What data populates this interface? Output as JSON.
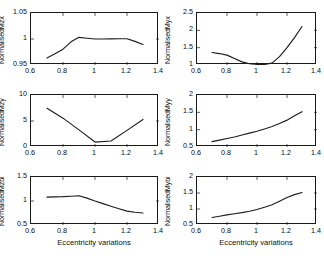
{
  "figure": {
    "type": "multi-panel-line-chart",
    "panels": 6,
    "rows": 3,
    "cols": 2,
    "shared_xlabel": "Eccentricity variations"
  },
  "chart_data": [
    {
      "id": "mzx",
      "type": "line",
      "title": "",
      "ylabel": "NormalisedMzx",
      "xlabel": "",
      "xlim": [
        0.6,
        1.4
      ],
      "ylim": [
        0.95,
        1.05
      ],
      "xticks": [
        0.6,
        0.8,
        1,
        1.2,
        1.4
      ],
      "xticklabels": [
        "0.6",
        "0.8",
        "1",
        "1.2",
        "1.4"
      ],
      "yticks": [
        0.95,
        1,
        1.05
      ],
      "yticklabels": [
        "0.95",
        "1",
        "1.05"
      ],
      "grid": false,
      "legend": null,
      "x": [
        0.7,
        0.75,
        0.8,
        0.85,
        0.9,
        0.95,
        1.0,
        1.05,
        1.1,
        1.15,
        1.2,
        1.25,
        1.3
      ],
      "values": [
        0.9635,
        0.9715,
        0.9805,
        0.9945,
        1.0032,
        1.0015,
        1.0,
        1.0,
        1.0003,
        1.0005,
        1.0005,
        0.9955,
        0.9895
      ]
    },
    {
      "id": "myx",
      "type": "line",
      "title": "",
      "ylabel": "NormalisedMyx",
      "xlabel": "",
      "xlim": [
        0.6,
        1.4
      ],
      "ylim": [
        1,
        2.5
      ],
      "xticks": [
        0.6,
        0.8,
        1,
        1.2,
        1.4
      ],
      "xticklabels": [
        "0.6",
        "0.8",
        "1",
        "1.2",
        "1.4"
      ],
      "yticks": [
        1,
        1.5,
        2,
        2.5
      ],
      "yticklabels": [
        "1",
        "1.5",
        "2",
        "2.5"
      ],
      "grid": false,
      "legend": null,
      "x": [
        0.7,
        0.75,
        0.8,
        0.85,
        0.9,
        0.95,
        1.0,
        1.05,
        1.1,
        1.15,
        1.2,
        1.25,
        1.3
      ],
      "values": [
        1.36,
        1.33,
        1.285,
        1.19,
        1.09,
        1.035,
        1.015,
        1.02,
        1.055,
        1.24,
        1.5,
        1.79,
        2.11
      ]
    },
    {
      "id": "mzy",
      "type": "line",
      "title": "",
      "ylabel": "NormalisedMzy",
      "xlabel": "",
      "xlim": [
        0.6,
        1.4
      ],
      "ylim": [
        0,
        10
      ],
      "xticks": [
        0.6,
        0.8,
        1,
        1.2,
        1.4
      ],
      "xticklabels": [
        "0.6",
        "0.8",
        "1",
        "1.2",
        "1.4"
      ],
      "yticks": [
        0,
        5,
        10
      ],
      "yticklabels": [
        "0",
        "5",
        "10"
      ],
      "grid": false,
      "legend": null,
      "x": [
        0.7,
        0.8,
        0.9,
        1.0,
        1.1,
        1.2,
        1.3
      ],
      "values": [
        7.45,
        5.55,
        3.3,
        0.95,
        1.15,
        3.2,
        5.3
      ]
    },
    {
      "id": "myy",
      "type": "line",
      "title": "",
      "ylabel": "NormalisedMyy",
      "xlabel": "",
      "xlim": [
        0.6,
        1.4
      ],
      "ylim": [
        0.5,
        2
      ],
      "xticks": [
        0.6,
        0.8,
        1,
        1.2,
        1.4
      ],
      "xticklabels": [
        "0.6",
        "0.8",
        "1",
        "1.2",
        "1.4"
      ],
      "yticks": [
        0.5,
        1,
        1.5,
        2
      ],
      "yticklabels": [
        "0.5",
        "1",
        "1.5",
        "2"
      ],
      "grid": false,
      "legend": null,
      "x": [
        0.7,
        0.75,
        0.8,
        0.85,
        0.9,
        0.95,
        1.0,
        1.05,
        1.1,
        1.15,
        1.2,
        1.25,
        1.3
      ],
      "values": [
        0.655,
        0.7,
        0.745,
        0.79,
        0.845,
        0.9,
        0.955,
        1.02,
        1.09,
        1.18,
        1.275,
        1.4,
        1.52
      ]
    },
    {
      "id": "mzbi",
      "type": "line",
      "title": "",
      "ylabel": "NormalisedMzbi",
      "xlabel": "Eccentricity variations",
      "xlim": [
        0.6,
        1.4
      ],
      "ylim": [
        0.5,
        1.5
      ],
      "xticks": [
        0.6,
        0.8,
        1,
        1.2,
        1.4
      ],
      "xticklabels": [
        "0.6",
        "0.8",
        "1",
        "1.2",
        "1.4"
      ],
      "yticks": [
        0.5,
        1,
        1.5
      ],
      "yticklabels": [
        "0.5",
        "1",
        "1.5"
      ],
      "grid": false,
      "legend": null,
      "x": [
        0.7,
        0.75,
        0.8,
        0.85,
        0.9,
        0.95,
        1.0,
        1.05,
        1.1,
        1.15,
        1.2,
        1.25,
        1.3
      ],
      "values": [
        1.08,
        1.085,
        1.09,
        1.1,
        1.11,
        1.06,
        1.0,
        0.945,
        0.89,
        0.84,
        0.79,
        0.765,
        0.75
      ]
    },
    {
      "id": "mybi",
      "type": "line",
      "title": "",
      "ylabel": "NormalisedMybi",
      "xlabel": "Eccentricity variations",
      "xlim": [
        0.6,
        1.4
      ],
      "ylim": [
        0.5,
        2
      ],
      "xticks": [
        0.6,
        0.8,
        1,
        1.2,
        1.4
      ],
      "xticklabels": [
        "0.6",
        "0.8",
        "1",
        "1.2",
        "1.4"
      ],
      "yticks": [
        0.5,
        1,
        1.5,
        2
      ],
      "yticklabels": [
        "0.5",
        "1",
        "1.5",
        "2"
      ],
      "grid": false,
      "legend": null,
      "x": [
        0.7,
        0.75,
        0.8,
        0.85,
        0.9,
        0.95,
        1.0,
        1.05,
        1.1,
        1.15,
        1.2,
        1.25,
        1.3
      ],
      "values": [
        0.735,
        0.775,
        0.815,
        0.85,
        0.885,
        0.93,
        0.985,
        1.055,
        1.135,
        1.245,
        1.36,
        1.45,
        1.515
      ]
    }
  ],
  "style": {
    "line_color": "#1c1c1c",
    "axis_color": "#1a1a1a",
    "background": "#ffffff"
  }
}
